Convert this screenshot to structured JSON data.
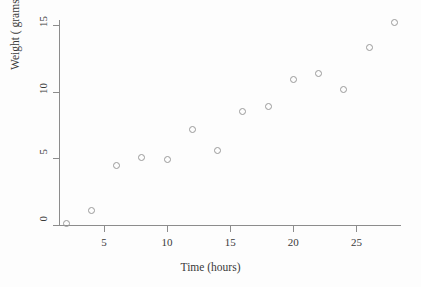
{
  "chart_data": {
    "type": "scatter",
    "title": "",
    "xlabel": "Time (hours)",
    "ylabel": "Weight ( grams)",
    "xlim": [
      1,
      28.8
    ],
    "ylim": [
      -0.4,
      15.6
    ],
    "xticks": [
      5,
      10,
      15,
      20,
      25
    ],
    "xtick_labels": [
      "5",
      "10",
      "15",
      "20",
      "25"
    ],
    "yticks": [
      0,
      5,
      10,
      15
    ],
    "ytick_labels": [
      "0",
      "5",
      "10",
      "15"
    ],
    "grid": false,
    "legend": null,
    "marker": "open-circle",
    "marker_color": "#9a9a9a",
    "axis_color": "#8c8c8c",
    "x": [
      2,
      4,
      6,
      8,
      10,
      12,
      14,
      16,
      18,
      20,
      22,
      24,
      26,
      28
    ],
    "y": [
      0.1,
      1.1,
      4.5,
      5.1,
      4.9,
      7.2,
      5.6,
      8.5,
      8.9,
      10.9,
      11.4,
      10.2,
      13.3,
      15.2
    ],
    "points": [
      {
        "x": 2,
        "y": 0.1
      },
      {
        "x": 4,
        "y": 1.1
      },
      {
        "x": 6,
        "y": 4.5
      },
      {
        "x": 8,
        "y": 5.1
      },
      {
        "x": 10,
        "y": 4.9
      },
      {
        "x": 12,
        "y": 7.2
      },
      {
        "x": 14,
        "y": 5.6
      },
      {
        "x": 16,
        "y": 8.5
      },
      {
        "x": 18,
        "y": 8.9
      },
      {
        "x": 20,
        "y": 10.9
      },
      {
        "x": 22,
        "y": 11.4
      },
      {
        "x": 24,
        "y": 10.2
      },
      {
        "x": 26,
        "y": 13.3
      },
      {
        "x": 28,
        "y": 15.2
      }
    ]
  }
}
